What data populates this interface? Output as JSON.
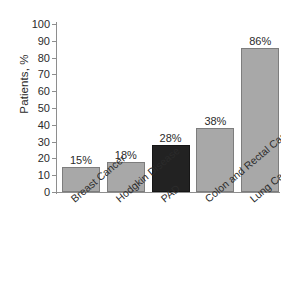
{
  "chart_data": {
    "type": "bar",
    "title": "",
    "subtitle": "",
    "xlabel": "",
    "ylabel": "Patients, %",
    "ylim": [
      0,
      100
    ],
    "ytick_step": 10,
    "yticks": [
      100,
      90,
      80,
      70,
      60,
      50,
      40,
      30,
      20,
      10,
      0
    ],
    "ytick_labels": [
      "100",
      "90",
      "80",
      "70",
      "60",
      "50",
      "40",
      "30",
      "20",
      "10",
      "0"
    ],
    "grid": false,
    "legend": false,
    "legend_position": "none",
    "categories": [
      "Breast Cancer",
      "Hodgkin Disease",
      "PAD",
      "Colon and Rectal Cancer",
      "Lung Cancer"
    ],
    "values": [
      15,
      18,
      28,
      38,
      86
    ],
    "value_labels": [
      "15%",
      "18%",
      "28%",
      "38%",
      "86%"
    ],
    "bar_colors": [
      "#a8a8a8",
      "#a8a8a8",
      "#222222",
      "#a8a8a8",
      "#a8a8a8"
    ],
    "highlight_category": "PAD",
    "category_label_rotation": -40
  },
  "colors": {
    "background": "#ffffff",
    "bar_gray": "#a8a8a8",
    "bar_dark": "#222222",
    "bar_outline": "#7d7d7d",
    "axis": "#8e8e8e",
    "text": "#2b2b2b"
  }
}
